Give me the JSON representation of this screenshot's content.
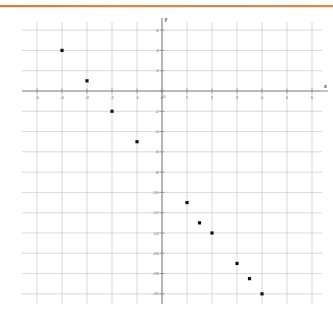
{
  "decor": {
    "top_rule_color": "#e07b2a"
  },
  "chart_data": {
    "type": "scatter",
    "title": "",
    "xlabel": "x",
    "ylabel": "y",
    "xlim": [
      -5.6,
      6.4
    ],
    "ylim": [
      -21.0,
      6.8
    ],
    "grid": true,
    "legend": "none",
    "xticks": [
      -5,
      -4,
      -3,
      -2,
      -1,
      0,
      1,
      2,
      3,
      4,
      5,
      6
    ],
    "xtick_labels": [
      "-5",
      "-4",
      "-3",
      "-2",
      "-1",
      "0",
      "1",
      "2",
      "3",
      "4",
      "5",
      "6"
    ],
    "yticks": [
      6,
      4,
      2,
      0,
      -2,
      -4,
      -6,
      -8,
      -10,
      -12,
      -14,
      -16,
      -18,
      -20
    ],
    "ytick_labels": [
      "6",
      "4",
      "2",
      "0",
      "-2",
      "-4",
      "-6",
      "-8",
      "-10",
      "-12",
      "-14",
      "-16",
      "-18",
      "-20"
    ],
    "x": [
      -4,
      -3,
      -2,
      -1,
      1,
      1.5,
      2,
      3,
      3.5,
      4
    ],
    "y": [
      4,
      1,
      -2,
      -5,
      -11,
      -13,
      -14,
      -17,
      -18.5,
      -20
    ],
    "points": [
      {
        "x": -4,
        "y": 4
      },
      {
        "x": -3,
        "y": 1
      },
      {
        "x": -2,
        "y": -2
      },
      {
        "x": -1,
        "y": -5
      },
      {
        "x": 1,
        "y": -11
      },
      {
        "x": 1.5,
        "y": -13
      },
      {
        "x": 2,
        "y": -14
      },
      {
        "x": 3,
        "y": -17
      },
      {
        "x": 3.5,
        "y": -18.5
      },
      {
        "x": 4,
        "y": -20
      }
    ],
    "marker": "square",
    "marker_color": "#111111",
    "grid_color": "#c9c9c9",
    "axis_color": "#8a8a8a"
  }
}
